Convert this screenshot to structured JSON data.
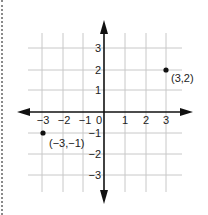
{
  "diagram": {
    "type": "coordinate-plane",
    "grid": {
      "x_min": -3,
      "x_max": 3,
      "y_min": -3,
      "y_max": 3,
      "step": 1
    },
    "x_tick_labels": [
      "−3",
      "−2",
      "−1",
      "0",
      "1",
      "2",
      "3"
    ],
    "y_tick_labels": [
      "3",
      "2",
      "1",
      "−1",
      "−2",
      "−3"
    ],
    "points": [
      {
        "x": 3,
        "y": 2,
        "label": "(3,2)"
      },
      {
        "x": -3,
        "y": -1,
        "label": "(−3,−1)"
      }
    ],
    "colors": {
      "grid": "#c8c8c8",
      "axis": "#111111",
      "point": "#111111",
      "border": "#8a8a8a"
    }
  }
}
